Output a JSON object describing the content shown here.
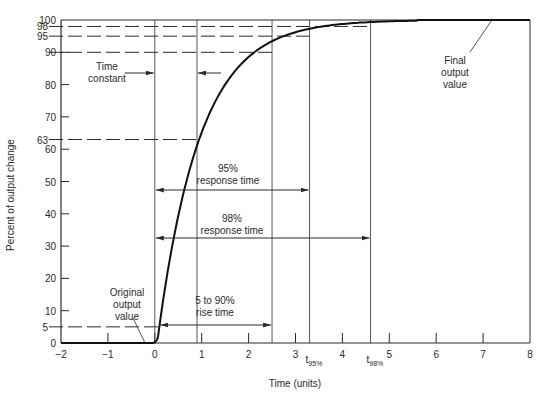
{
  "chart_data": {
    "type": "line",
    "title": "",
    "xlabel": "Time (units)",
    "ylabel": "Percent of output change",
    "xlim": [
      -2,
      8
    ],
    "ylim": [
      0,
      100
    ],
    "grid": false,
    "x_ticks": [
      -2,
      -1,
      0,
      1,
      2,
      3,
      4,
      5,
      6,
      7,
      8
    ],
    "x_tick_labels": [
      "−2",
      "−1",
      "0",
      "1",
      "2",
      "3",
      "4",
      "5",
      "6",
      "7",
      "8"
    ],
    "y_ticks": [
      0,
      10,
      20,
      30,
      40,
      50,
      60,
      70,
      80,
      90,
      100
    ],
    "y_tick_labels": [
      "0",
      "10",
      "20",
      "30",
      "40",
      "50",
      "60",
      "70",
      "80",
      "90",
      "100"
    ],
    "y_reference_labels": [
      "5",
      "63",
      "95",
      "98"
    ],
    "series": [
      {
        "name": "Output response",
        "x": [
          -2,
          -1,
          0,
          0.05,
          0.1,
          0.2,
          0.5,
          0.9,
          1.0,
          1.5,
          2.0,
          2.5,
          3.0,
          3.3,
          4.0,
          4.6,
          5.0,
          5.5,
          6,
          7,
          8
        ],
        "y": [
          0,
          0,
          0,
          1,
          5,
          17,
          42,
          63,
          66,
          79,
          87,
          90,
          93,
          95,
          97,
          98,
          99,
          100,
          100,
          100,
          100
        ]
      }
    ],
    "reference_lines": {
      "horizontal_dashed": [
        {
          "y": 98,
          "label": "98"
        },
        {
          "y": 95,
          "label": "95"
        },
        {
          "y": 90,
          "label": "90"
        },
        {
          "y": 63,
          "label": "63"
        },
        {
          "y": 5,
          "label": "5"
        }
      ],
      "vertical": [
        {
          "x": 0,
          "label": ""
        },
        {
          "x": 0.9,
          "label": ""
        },
        {
          "x": 2.5,
          "label": ""
        },
        {
          "x": 3.3,
          "label": "t95%"
        },
        {
          "x": 4.6,
          "label": "t98%"
        }
      ]
    },
    "annotations": [
      {
        "text_lines": [
          "Time",
          "constant"
        ],
        "type": "interval",
        "from": 0,
        "to": 0.9,
        "y": 85
      },
      {
        "text_lines": [
          "95%",
          "response time"
        ],
        "type": "interval",
        "from": 0,
        "to": 3.3,
        "y": 47
      },
      {
        "text_lines": [
          "98%",
          "response time"
        ],
        "type": "interval",
        "from": 0,
        "to": 4.6,
        "y": 32
      },
      {
        "text_lines": [
          "5 to 90%",
          "rise time"
        ],
        "type": "interval",
        "from": 0.1,
        "to": 2.5,
        "y": 5
      },
      {
        "text_lines": [
          "Original",
          "output",
          "value"
        ],
        "type": "callout",
        "x": -0.3,
        "y": 0
      },
      {
        "text_lines": [
          "Final",
          "output",
          "value"
        ],
        "type": "callout",
        "x": 7.2,
        "y": 100
      }
    ],
    "special_x_labels": [
      {
        "x": 3.3,
        "main": "t",
        "sub": "95%"
      },
      {
        "x": 4.6,
        "main": "t",
        "sub": "98%"
      }
    ]
  },
  "colors": {
    "ink": "#2a2a2a",
    "light_ink": "#555555",
    "background": "#ffffff"
  }
}
